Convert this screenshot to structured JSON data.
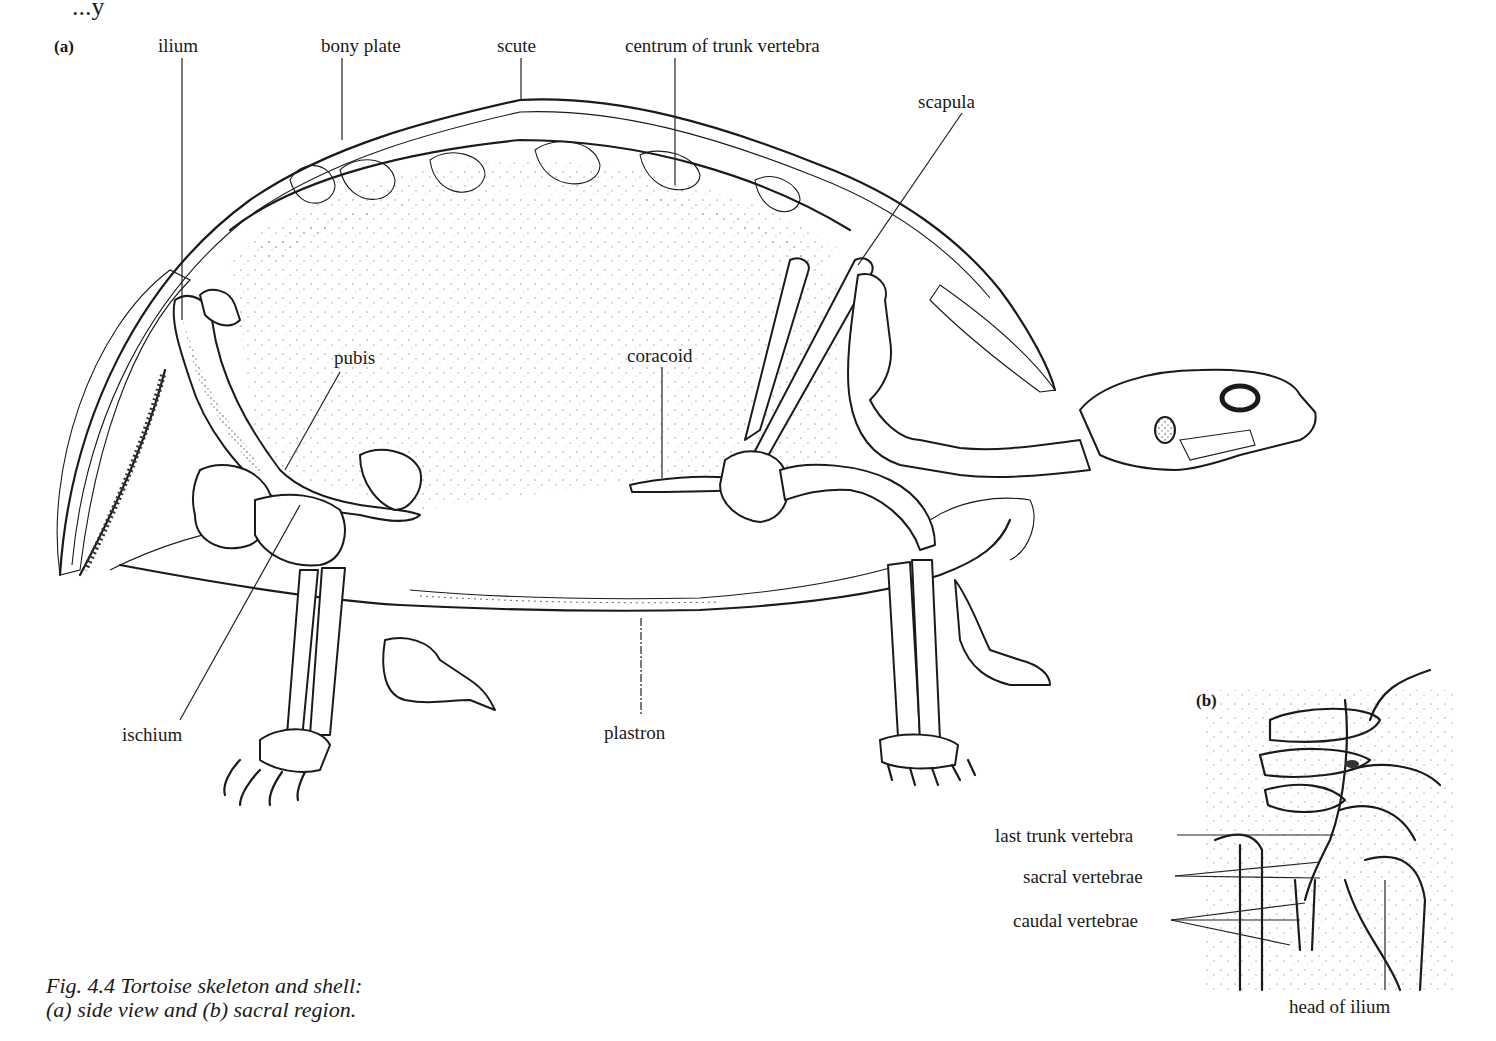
{
  "figure": {
    "top_fragment": "...y",
    "panel_a": {
      "tag": "(a)",
      "labels": {
        "ilium": "ilium",
        "bony_plate": "bony plate",
        "scute": "scute",
        "centrum": "centrum of trunk vertebra",
        "scapula": "scapula",
        "pubis": "pubis",
        "coracoid": "coracoid",
        "ischium": "ischium",
        "plastron": "plastron"
      }
    },
    "panel_b": {
      "tag": "(b)",
      "labels": {
        "last_trunk": "last trunk vertebra",
        "sacral": "sacral vertebrae",
        "caudal": "caudal vertebrae",
        "head_ilium": "head of ilium"
      }
    },
    "caption": {
      "line1": "Fig. 4.4  Tortoise skeleton and shell:",
      "line2": "(a) side view and (b) sacral region."
    }
  },
  "colors": {
    "ink": "#1a1a1a",
    "stipple": "#777777",
    "paper": "#ffffff"
  }
}
